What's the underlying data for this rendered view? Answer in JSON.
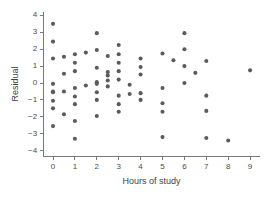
{
  "chart_data": {
    "type": "scatter",
    "title": "",
    "xlabel": "Hours of study",
    "ylabel": "Residual",
    "xlim": [
      -0.45,
      9.45
    ],
    "ylim": [
      -4.35,
      4.2
    ],
    "xticks": [
      0,
      1,
      2,
      3,
      4,
      5,
      6,
      7,
      8,
      9
    ],
    "yticks": [
      4,
      3,
      2,
      1,
      0,
      -1,
      -2,
      -3,
      -4
    ],
    "xtick_labels": [
      "0",
      "1",
      "2",
      "3",
      "4",
      "5",
      "6",
      "7",
      "8",
      "9"
    ],
    "ytick_labels": [
      "4",
      "3",
      "2",
      "1",
      "0",
      "-1",
      "-2",
      "-3",
      "-4"
    ],
    "grid": false,
    "legend": "none",
    "marker": "filled-circle",
    "marker_color": "#5a5b5f",
    "marker_size_px": 4.1,
    "axis_color": "#77787b",
    "n_points": 73,
    "points": [
      [
        0,
        3.5
      ],
      [
        0,
        2.45
      ],
      [
        0,
        1.45
      ],
      [
        0,
        -0.05
      ],
      [
        0,
        -0.5
      ],
      [
        0,
        -0.55
      ],
      [
        0,
        -1.05
      ],
      [
        0,
        -1.5
      ],
      [
        0,
        -2.55
      ],
      [
        0.5,
        1.55
      ],
      [
        0.5,
        0.55
      ],
      [
        0.5,
        -0.5
      ],
      [
        0.5,
        -1.85
      ],
      [
        1,
        1.7
      ],
      [
        1,
        1.2
      ],
      [
        1,
        0.7
      ],
      [
        1,
        -0.3
      ],
      [
        1,
        -0.8
      ],
      [
        1,
        -1.25
      ],
      [
        1,
        -2.25
      ],
      [
        1,
        -3.3
      ],
      [
        1.5,
        1.8
      ],
      [
        1.5,
        -0.15
      ],
      [
        2,
        2.95
      ],
      [
        2,
        1.95
      ],
      [
        2,
        0.9
      ],
      [
        2,
        0.05
      ],
      [
        2,
        -0.05
      ],
      [
        2,
        -0.55
      ],
      [
        2,
        -1.0
      ],
      [
        2,
        -1.95
      ],
      [
        2.5,
        1.6
      ],
      [
        2.5,
        0.65
      ],
      [
        2.5,
        0.45
      ],
      [
        2.5,
        0.15
      ],
      [
        2.5,
        -0.2
      ],
      [
        3,
        2.25
      ],
      [
        3,
        1.7
      ],
      [
        3,
        1.2
      ],
      [
        3,
        0.7
      ],
      [
        3,
        0.2
      ],
      [
        3,
        -0.75
      ],
      [
        3,
        -1.25
      ],
      [
        3,
        -1.7
      ],
      [
        3.5,
        -0.1
      ],
      [
        3.5,
        -0.65
      ],
      [
        4,
        1.45
      ],
      [
        4,
        0.95
      ],
      [
        4,
        0.5
      ],
      [
        4,
        -0.6
      ],
      [
        4,
        -1.0
      ],
      [
        5,
        1.75
      ],
      [
        5,
        -0.3
      ],
      [
        5,
        -1.2
      ],
      [
        5,
        -1.7
      ],
      [
        5,
        -3.2
      ],
      [
        5.5,
        1.35
      ],
      [
        6,
        2.95
      ],
      [
        6,
        2.0
      ],
      [
        6,
        1.0
      ],
      [
        6,
        0.0
      ],
      [
        6.5,
        0.6
      ],
      [
        7,
        1.3
      ],
      [
        7,
        -0.75
      ],
      [
        7,
        -1.65
      ],
      [
        7,
        -3.25
      ],
      [
        8,
        -3.4
      ],
      [
        9,
        0.75
      ]
    ]
  },
  "figure": {
    "background": "#ffffff",
    "width": 265,
    "height": 200
  }
}
